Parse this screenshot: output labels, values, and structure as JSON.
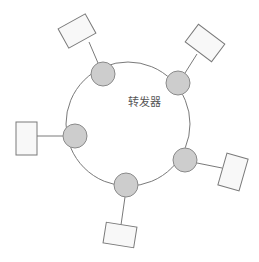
{
  "diagram": {
    "title_label": "转发器",
    "type": "ring-topology",
    "colors": {
      "ring_stroke": "#7a7a7a",
      "node_fill": "#cdcdcd",
      "node_stroke": "#8a8a8a",
      "station_fill": "#f8f8f8",
      "station_stroke": "#7a7a7a",
      "label": "#555555"
    },
    "ring": {
      "cx": 128,
      "cy": 124,
      "r": 62
    },
    "repeaters": [
      {
        "id": "top-left",
        "cx": 103,
        "cy": 74,
        "r": 12
      },
      {
        "id": "top-right",
        "cx": 178,
        "cy": 83,
        "r": 12
      },
      {
        "id": "left",
        "cx": 75,
        "cy": 136,
        "r": 12
      },
      {
        "id": "bottom-right",
        "cx": 185,
        "cy": 160,
        "r": 12
      },
      {
        "id": "bottom",
        "cx": 126,
        "cy": 185,
        "r": 12
      }
    ],
    "stations": [
      {
        "id": "top-left",
        "cx": 77,
        "cy": 31,
        "w": 31,
        "h": 22,
        "rotate": -29
      },
      {
        "id": "top-right",
        "cx": 205,
        "cy": 43,
        "w": 33,
        "h": 22,
        "rotate": 37
      },
      {
        "id": "left",
        "cx": 26.5,
        "cy": 138.5,
        "w": 21,
        "h": 33,
        "rotate": 0
      },
      {
        "id": "bottom-right",
        "cx": 233,
        "cy": 172,
        "w": 22,
        "h": 33,
        "rotate": 16
      },
      {
        "id": "bottom",
        "cx": 120,
        "cy": 235,
        "w": 31,
        "h": 21,
        "rotate": 9
      }
    ]
  }
}
